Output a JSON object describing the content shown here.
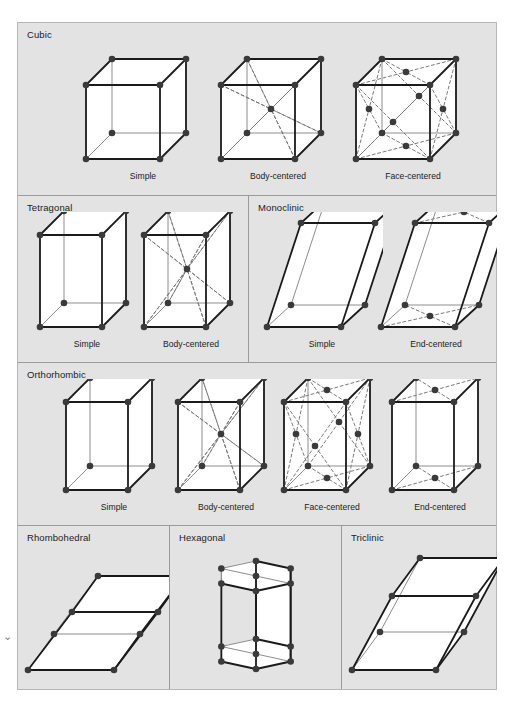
{
  "figure": {
    "background": "#e3e3e3",
    "border_color": "#b6b6b6",
    "divider_color": "#9a9a9a",
    "node_color": "#3a3a3a",
    "edge_color": "#1a1a1a",
    "back_edge_color": "#8d8d8d",
    "dashed_color": "#7a7a7a",
    "face_fill": "#ffffff"
  },
  "rows": [
    {
      "name": "cubic-row",
      "height": 172,
      "groups": [
        {
          "system": "Cubic",
          "left": 0,
          "width": 478,
          "divided": false,
          "cells": [
            {
              "label": "Simple",
              "shape": "cube",
              "type": "simple",
              "left": 60,
              "width": 130
            },
            {
              "label": "Body-centered",
              "shape": "cube",
              "type": "body-centered",
              "left": 195,
              "width": 130
            },
            {
              "label": "Face-centered",
              "shape": "cube",
              "type": "face-centered",
              "left": 330,
              "width": 130
            }
          ]
        }
      ]
    },
    {
      "name": "tetragonal-monoclinic-row",
      "height": 167,
      "groups": [
        {
          "system": "Tetragonal",
          "left": 0,
          "width": 230,
          "divided": false,
          "cells": [
            {
              "label": "Simple",
              "shape": "tetra",
              "type": "simple",
              "left": 14,
              "width": 110
            },
            {
              "label": "Body-centered",
              "shape": "tetra",
              "type": "body-centered",
              "left": 118,
              "width": 110
            }
          ]
        },
        {
          "system": "Monoclinic",
          "left": 230,
          "width": 248,
          "divided": true,
          "cells": [
            {
              "label": "Simple",
              "shape": "mono",
              "type": "simple",
              "left": 12,
              "width": 122
            },
            {
              "label": "End-centered",
              "shape": "mono",
              "type": "end-centered",
              "left": 126,
              "width": 122
            }
          ]
        }
      ]
    },
    {
      "name": "orthorhombic-row",
      "height": 163,
      "groups": [
        {
          "system": "Orthorhombic",
          "left": 0,
          "width": 478,
          "divided": false,
          "cells": [
            {
              "label": "Simple",
              "shape": "ortho",
              "type": "simple",
              "left": 40,
              "width": 112
            },
            {
              "label": "Body-centered",
              "shape": "ortho",
              "type": "body-centered",
              "left": 152,
              "width": 112
            },
            {
              "label": "Face-centered",
              "shape": "ortho",
              "type": "face-centered",
              "left": 258,
              "width": 112
            },
            {
              "label": "End-centered",
              "shape": "ortho",
              "type": "end-centered",
              "left": 366,
              "width": 112
            }
          ]
        }
      ]
    },
    {
      "name": "rhombohedral-hexagonal-triclinic-row",
      "height": 164,
      "groups": [
        {
          "system": "Rhombohedral",
          "left": 0,
          "width": 151,
          "divided": false,
          "cells": [
            {
              "label": "",
              "shape": "rhombo",
              "type": "simple",
              "left": 4,
              "width": 147
            }
          ]
        },
        {
          "system": "Hexagonal",
          "left": 151,
          "width": 172,
          "divided": true,
          "cells": [
            {
              "label": "",
              "shape": "hex",
              "type": "simple",
              "left": 14,
              "width": 144
            }
          ]
        },
        {
          "system": "Triclinic",
          "left": 323,
          "width": 155,
          "divided": true,
          "cells": [
            {
              "label": "",
              "shape": "tri",
              "type": "simple",
              "left": 4,
              "width": 151
            }
          ]
        }
      ]
    }
  ],
  "corner_mark": "⌄"
}
